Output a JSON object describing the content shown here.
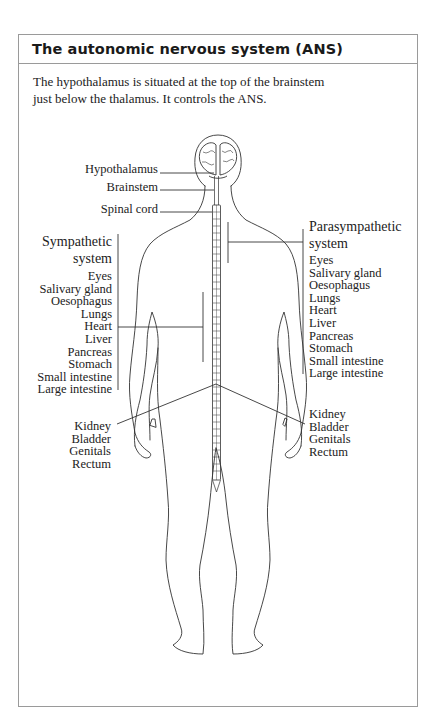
{
  "box": {
    "title": "The autonomic nervous system (ANS)",
    "intro_lines": [
      "The hypothalamus is situated at the top of the brainstem",
      "just below the thalamus. It controls the ANS."
    ]
  },
  "diagram": {
    "structure_labels": {
      "hypothalamus": "Hypothalamus",
      "brainstem": "Brainstem",
      "spinal_cord": "Spinal cord"
    },
    "sympathetic": {
      "title_lines": [
        "Sympathetic",
        "system"
      ],
      "organs": [
        "Eyes",
        "Salivary gland",
        "Oesophagus",
        "Lungs",
        "Heart",
        "Liver",
        "Pancreas",
        "Stomach",
        "Small intestine",
        "Large intestine"
      ],
      "lower_organs": [
        "Kidney",
        "Bladder",
        "Genitals",
        "Rectum"
      ]
    },
    "parasympathetic": {
      "title_lines": [
        "Parasympathetic",
        "system"
      ],
      "organs": [
        "Eyes",
        "Salivary gland",
        "Oesophagus",
        "Lungs",
        "Heart",
        "Liver",
        "Pancreas",
        "Stomach",
        "Small intestine",
        "Large intestine"
      ],
      "lower_organs": [
        "Kidney",
        "Bladder",
        "Genitals",
        "Rectum"
      ]
    },
    "colors": {
      "line": "#333333",
      "border": "#9a9a9a",
      "text": "#222222"
    }
  }
}
